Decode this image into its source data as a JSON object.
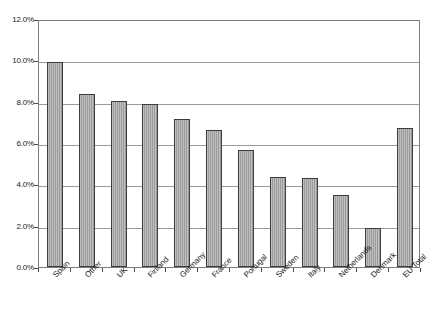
{
  "chart_data": {
    "type": "bar",
    "title": "",
    "xlabel": "",
    "ylabel": "",
    "ylim": [
      0,
      12
    ],
    "ytick_labels": [
      "12.0%",
      "10.0%",
      "8.0%",
      "6.0%",
      "4.0%",
      "2.0%",
      "0.0%"
    ],
    "ytick_values": [
      12.0,
      10.0,
      8.0,
      6.0,
      4.0,
      2.0,
      0.0
    ],
    "grid": true,
    "legend": false,
    "value_suffix": "%",
    "categories": [
      "Spain",
      "Other",
      "UK",
      "Finland",
      "Germany",
      "France",
      "Portugal",
      "Sweden",
      "Italy",
      "Netherlands",
      "Denmark",
      "EU Total"
    ],
    "values": [
      9.9,
      8.35,
      8.05,
      7.9,
      7.15,
      6.65,
      5.65,
      4.35,
      4.3,
      3.5,
      1.9,
      6.75
    ],
    "bar_color": "#a3a3a3",
    "bar_border_color": "#3d3d3d",
    "grid_color": "#9a9a9a",
    "frame_color": "#7d7d7d",
    "text_color": "#1a1a1a",
    "background_color": "#ffffff"
  }
}
